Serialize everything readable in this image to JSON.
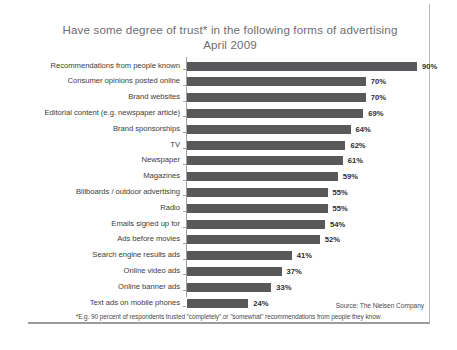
{
  "chart_data": {
    "type": "bar",
    "orientation": "horizontal",
    "title": "Have some degree of trust* in the following forms of advertising",
    "subtitle": "April 2009",
    "xlabel": "",
    "ylabel": "",
    "xlim": [
      0,
      100
    ],
    "grid": false,
    "legend": null,
    "value_suffix": "%",
    "categories": [
      "Recommendations from people known",
      "Consumer opinions posted online",
      "Brand websites",
      "Editorial content (e.g. newspaper article)",
      "Brand sponsorships",
      "TV",
      "Newspaper",
      "Magazines",
      "Billboards / outdoor advertising",
      "Radio",
      "Emails signed up for",
      "Ads before movies",
      "Search engine results ads",
      "Online video ads",
      "Online banner ads",
      "Text ads on mobile phones"
    ],
    "values": [
      90,
      70,
      70,
      69,
      64,
      62,
      61,
      59,
      55,
      55,
      54,
      52,
      41,
      37,
      33,
      24
    ],
    "value_labels": [
      "90%",
      "70%",
      "70%",
      "69%",
      "64%",
      "62%",
      "61%",
      "59%",
      "55%",
      "55%",
      "54%",
      "52%",
      "41%",
      "37%",
      "33%",
      "24%"
    ],
    "bar_color": "#59595b",
    "axis_color": "#a0a0a2",
    "title_color": "#6d6d70",
    "source": "Source: The Nielsen Company",
    "footnote": "*E.g. 90 percent of respondents trusted \"completely\" or \"somewhat\" recommendations from people they know"
  }
}
